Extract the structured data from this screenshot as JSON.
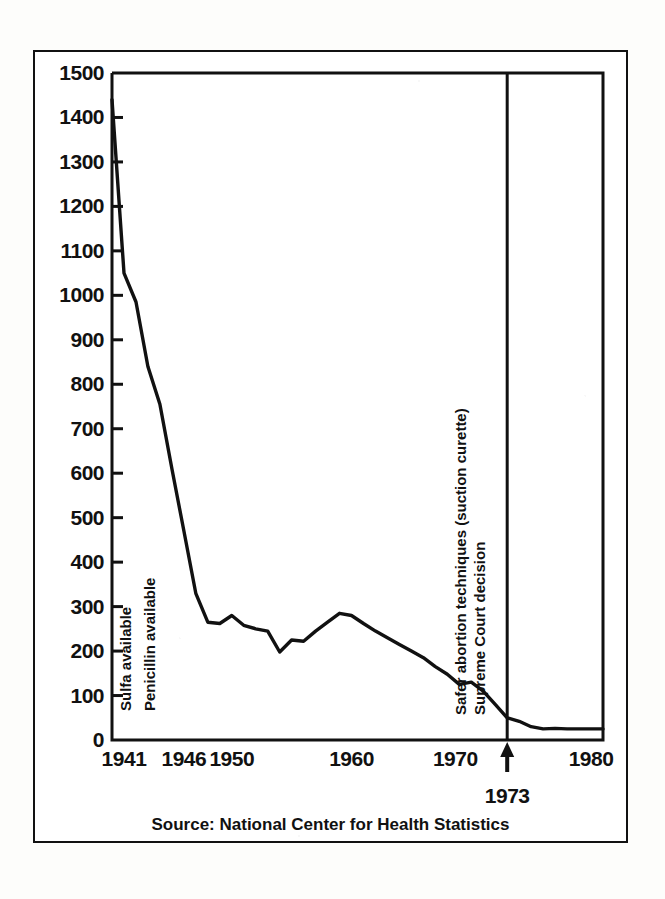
{
  "figure": {
    "source_caption": "Source: National Center for Health Statistics",
    "highlight_year": "1973",
    "arrow_glyph": "↑"
  },
  "chart_data": {
    "type": "line",
    "title": "",
    "xlabel": "",
    "ylabel": "",
    "xlim": [
      1940,
      1981
    ],
    "ylim": [
      0,
      1500
    ],
    "grid": false,
    "legend": null,
    "y_ticks": [
      0,
      100,
      200,
      300,
      400,
      500,
      600,
      700,
      800,
      900,
      1000,
      1100,
      1200,
      1300,
      1400,
      1500
    ],
    "y_tick_labels": [
      "0",
      "100",
      "200",
      "300",
      "400",
      "500",
      "600",
      "700",
      "800",
      "900",
      "1000",
      "1100",
      "1200",
      "1300",
      "1400",
      "1500"
    ],
    "x_ticks": [
      1941,
      1946,
      1950,
      1960,
      1970,
      1980
    ],
    "x_tick_labels": [
      "1941",
      "1946",
      "1950",
      "1960",
      "1970",
      "1980"
    ],
    "series": [
      {
        "name": "Deaths",
        "x": [
          1940,
          1941,
          1942,
          1943,
          1944,
          1945,
          1946,
          1947,
          1948,
          1949,
          1950,
          1951,
          1952,
          1953,
          1954,
          1955,
          1956,
          1957,
          1958,
          1959,
          1960,
          1961,
          1962,
          1963,
          1964,
          1965,
          1966,
          1967,
          1968,
          1969,
          1970,
          1971,
          1972,
          1973,
          1974,
          1975,
          1976,
          1977,
          1978,
          1979,
          1980,
          1981
        ],
        "values": [
          1440,
          1050,
          985,
          840,
          755,
          610,
          470,
          330,
          265,
          262,
          280,
          258,
          250,
          245,
          198,
          225,
          222,
          245,
          265,
          285,
          280,
          262,
          245,
          230,
          215,
          200,
          185,
          165,
          148,
          125,
          130,
          110,
          80,
          50,
          42,
          30,
          25,
          26,
          25,
          25,
          25,
          25
        ]
      }
    ],
    "annotations": [
      {
        "id": "sulfa",
        "label": "Sulfa available",
        "x_year": 1941,
        "orientation": "vertical",
        "has_rule": false
      },
      {
        "id": "penicillin",
        "label": "Penicillin available",
        "x_year": 1943,
        "orientation": "vertical",
        "has_rule": false
      },
      {
        "id": "suction-curette",
        "label": "Safer abortion techniques (suction curette)",
        "x_year": 1969,
        "orientation": "vertical",
        "has_rule": false
      },
      {
        "id": "supreme-court",
        "label": "Supreme Court decision",
        "x_year": 1973,
        "orientation": "vertical",
        "has_rule": true
      }
    ]
  },
  "colors": {
    "ink": "#111111",
    "paper": "#ffffff",
    "line": "#111111"
  }
}
